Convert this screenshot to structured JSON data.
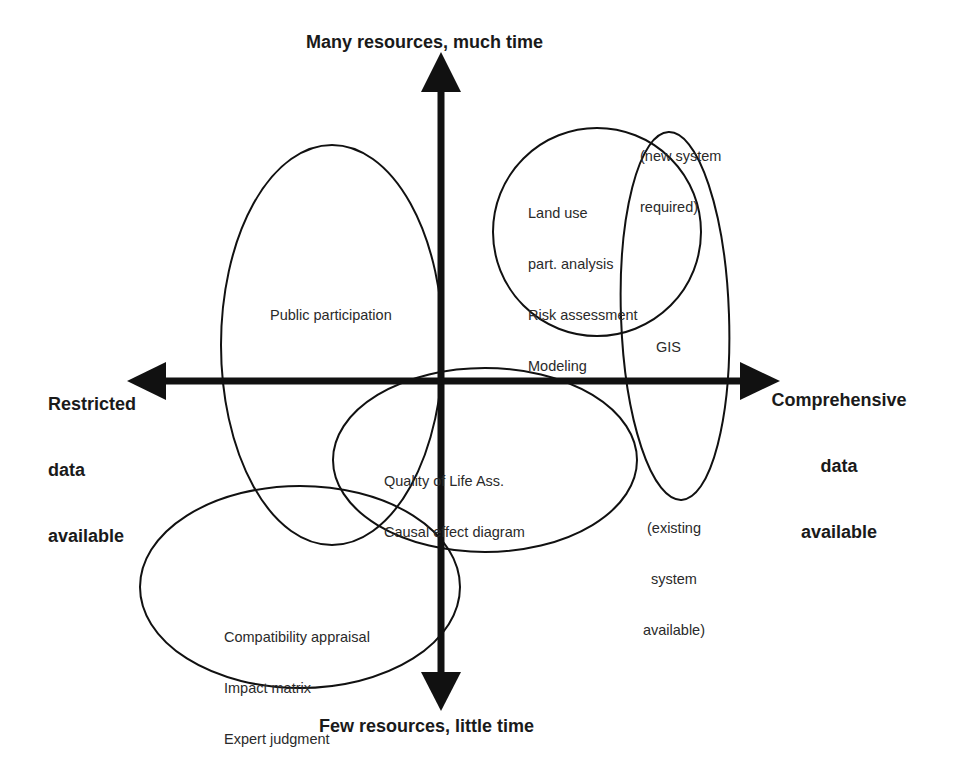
{
  "diagram": {
    "type": "two-axis positioning diagram",
    "axes": {
      "vertical": {
        "top_label": "Many resources, much time",
        "bottom_label": "Few resources, little time"
      },
      "horizontal": {
        "left_label": "Restricted data available",
        "left_label_lines": [
          "Restricted",
          "data",
          "available"
        ],
        "right_label": "Comprehensive data available",
        "right_label_lines": [
          "Comprehensive",
          "data",
          "available"
        ]
      }
    },
    "regions": [
      {
        "id": "public-participation",
        "lines": [
          "Public participation"
        ]
      },
      {
        "id": "land-use",
        "lines": [
          "Land use",
          "part. analysis",
          "Risk assessment",
          "Modeling"
        ]
      },
      {
        "id": "gis",
        "lines": [
          "GIS"
        ],
        "top_note_lines": [
          "(new system",
          "required)"
        ],
        "bottom_note_lines": [
          "(existing",
          "system",
          "available)"
        ]
      },
      {
        "id": "quality-of-life",
        "lines": [
          "Quality of Life Ass.",
          "Causal effect diagram"
        ]
      },
      {
        "id": "compatibility",
        "lines": [
          "Compatibility appraisal",
          "Impact matrix",
          "Expert judgment"
        ]
      }
    ],
    "colors": {
      "background": "#ffffff",
      "stroke": "#111111",
      "text": "#222222"
    }
  }
}
